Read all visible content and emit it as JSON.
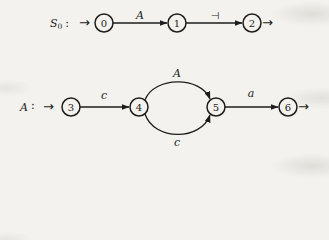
{
  "figure": {
    "type": "state-transition-diagrams",
    "background": "#f3f2ee",
    "ink": "#1d1d1d"
  },
  "diagrams": [
    {
      "label": {
        "base": "S",
        "subscript": "0",
        "separator": ":"
      },
      "start_arrow": "→",
      "end_arrow": "→",
      "states": [
        {
          "id": "0"
        },
        {
          "id": "1"
        },
        {
          "id": "2"
        }
      ],
      "edges": [
        {
          "from": "0",
          "to": "1",
          "label": "A",
          "shape": "straight"
        },
        {
          "from": "1",
          "to": "2",
          "label": "⊣",
          "shape": "straight"
        }
      ]
    },
    {
      "label": {
        "base": "A",
        "subscript": "",
        "separator": ":"
      },
      "start_arrow": "→",
      "end_arrow": "→",
      "states": [
        {
          "id": "3"
        },
        {
          "id": "4"
        },
        {
          "id": "5"
        },
        {
          "id": "6"
        }
      ],
      "edges": [
        {
          "from": "3",
          "to": "4",
          "label": "c",
          "shape": "straight"
        },
        {
          "from": "4",
          "to": "5",
          "label": "A",
          "shape": "curve-top"
        },
        {
          "from": "4",
          "to": "5",
          "label": "c",
          "shape": "curve-bottom"
        },
        {
          "from": "5",
          "to": "6",
          "label": "a",
          "shape": "straight"
        }
      ]
    }
  ]
}
